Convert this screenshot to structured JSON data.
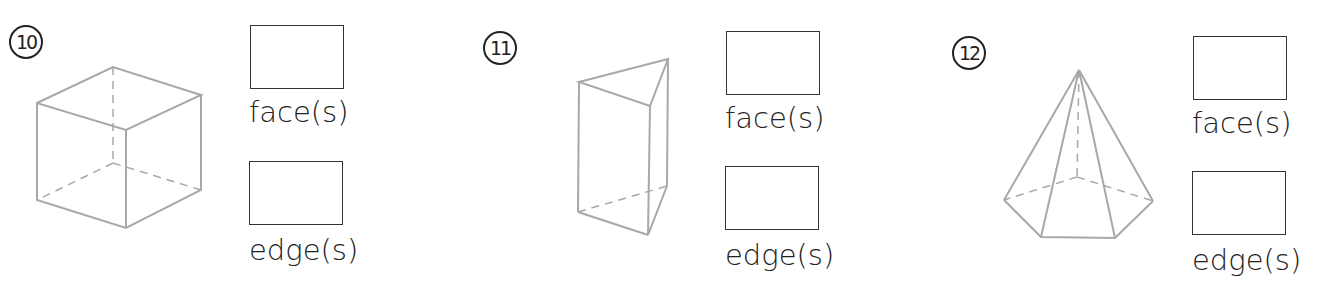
{
  "problems": [
    {
      "number": "10",
      "shape": "cube",
      "face_label": "face(s)",
      "edge_label": "edge(s)",
      "face_answer": "",
      "edge_answer": ""
    },
    {
      "number": "11",
      "shape": "triangular-prism",
      "face_label": "face(s)",
      "edge_label": "edge(s)",
      "face_answer": "",
      "edge_answer": ""
    },
    {
      "number": "12",
      "shape": "pentagonal-pyramid",
      "face_label": "face(s)",
      "edge_label": "edge(s)",
      "face_answer": "",
      "edge_answer": ""
    }
  ],
  "colors": {
    "shape_stroke": "#a8a8a8",
    "box_stroke": "#333333",
    "text": "#222222"
  }
}
